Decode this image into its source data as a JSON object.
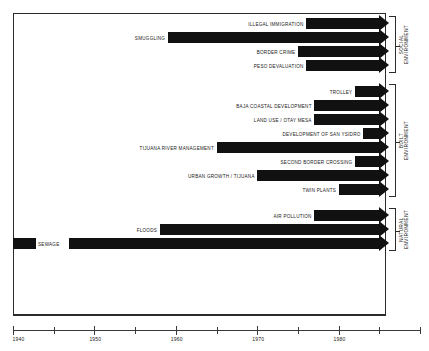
{
  "chart_data": {
    "type": "bar",
    "title": "",
    "subtitle": "",
    "xlabel": "",
    "ylabel": "",
    "orientation": "horizontal",
    "grid": false,
    "legend": "none",
    "xlim": [
      1940,
      1990
    ],
    "axis": {
      "major_ticks": [
        1940,
        1950,
        1960,
        1970,
        1980
      ],
      "major_tick_labels": [
        "1940",
        "1950",
        "1960",
        "1970",
        "1980"
      ],
      "minor_ticks": [
        1945,
        1955,
        1965,
        1975,
        1985,
        1990
      ]
    },
    "note": "Each bar is an arrow spanning from its start year to 1985 (open-ended arrowhead).",
    "groups": [
      {
        "name": "SOCIAL ENVIRONMENT",
        "label_lines": [
          "SOCIAL",
          "ENVIRONMENT"
        ],
        "bars": [
          {
            "label": "ILLEGAL IMMIGRATION",
            "start": 1976,
            "end": 1985
          },
          {
            "label": "SMUGGLING",
            "start": 1959,
            "end": 1985
          },
          {
            "label": "BORDER CRIME",
            "start": 1975,
            "end": 1985
          },
          {
            "label": "PESO DEVALUATION",
            "start": 1976,
            "end": 1985
          }
        ]
      },
      {
        "name": "BUILT ENVIRONMENT",
        "label_lines": [
          "BUILT",
          "ENVIRONMENT"
        ],
        "bars": [
          {
            "label": "TROLLEY",
            "start": 1982,
            "end": 1985
          },
          {
            "label": "BAJA COASTAL DEVELOPMENT",
            "start": 1977,
            "end": 1985
          },
          {
            "label": "LAND USE / OTAY MESA",
            "start": 1977,
            "end": 1985
          },
          {
            "label": "DEVELOPMENT OF SAN YSIDRO",
            "start": 1983,
            "end": 1985
          },
          {
            "label": "TIJUANA RIVER MANAGEMENT",
            "start": 1965,
            "end": 1985
          },
          {
            "label": "SECOND BORDER CROSSING",
            "start": 1982,
            "end": 1985
          },
          {
            "label": "URBAN GROWTH / TIJUANA",
            "start": 1970,
            "end": 1985
          },
          {
            "label": "TWIN PLANTS",
            "start": 1980,
            "end": 1985
          }
        ]
      },
      {
        "name": "NATURAL ENVIRONMENT",
        "label_lines": [
          "NATURAL",
          "ENVIRONMENT"
        ],
        "bars": [
          {
            "label": "AIR POLLUTION",
            "start": 1977,
            "end": 1985
          },
          {
            "label": "FLOODS",
            "start": 1958,
            "end": 1985
          },
          {
            "label": "SEWAGE",
            "start": 1940,
            "end": 1985
          }
        ]
      }
    ]
  },
  "colors": {
    "bar": "#111111",
    "frame": "#2b2b2b",
    "axis": "#3a3a3a",
    "text": "#1a1a1a",
    "background": "#ffffff"
  }
}
